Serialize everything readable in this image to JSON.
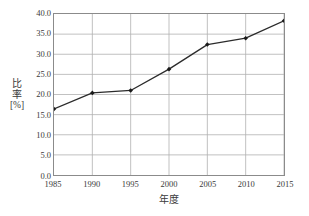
{
  "chart_data": {
    "type": "line",
    "title": "",
    "xlabel": "年度",
    "ylabel": "比率 [%]",
    "ylabel_lines": [
      "比",
      "率",
      "[%]"
    ],
    "categories": [
      "1985",
      "1990",
      "1995",
      "2000",
      "2005",
      "2010",
      "2015"
    ],
    "x": [
      1985,
      1990,
      1995,
      2000,
      2005,
      2010,
      2015
    ],
    "values": [
      16.4,
      20.4,
      21.0,
      26.3,
      32.4,
      34.0,
      38.3
    ],
    "series": [
      {
        "name": "比率",
        "values": [
          16.4,
          20.4,
          21.0,
          26.3,
          32.4,
          34.0,
          38.3
        ]
      }
    ],
    "ylim": [
      0.0,
      40.0
    ],
    "xlim": [
      1985,
      2015
    ],
    "yticks": [
      "0.0",
      "5.0",
      "10.0",
      "15.0",
      "20.0",
      "25.0",
      "30.0",
      "35.0",
      "40.0"
    ],
    "ytick_values": [
      0.0,
      5.0,
      10.0,
      15.0,
      20.0,
      25.0,
      30.0,
      35.0,
      40.0
    ],
    "xticks": [
      "1985",
      "1990",
      "1995",
      "2000",
      "2005",
      "2010",
      "2015"
    ],
    "grid": true,
    "grid_axes": "both",
    "legend": false,
    "legend_position": "none",
    "marker": "diamond",
    "line_color": "#2b2b2b",
    "marker_color": "#1a1a1a",
    "grid_color": "#b0b0b0",
    "frame_color": "#8b8b8b",
    "background_color": "#ffffff",
    "text_color": "#3a3a3a"
  }
}
